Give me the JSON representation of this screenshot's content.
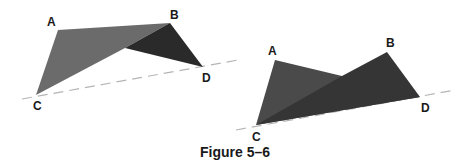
{
  "caption": "Figure 5–6",
  "colors": {
    "light_face": "#6b6b6b",
    "dark_face": "#2a2a2a",
    "right_face_a": "#4a4a4a",
    "right_face_b": "#3a3a3a",
    "dashed_line": "#b5b5b5",
    "text": "#1a1a1a"
  },
  "figures": [
    {
      "name": "left-quadrilateral",
      "labels": {
        "A": "A",
        "B": "B",
        "C": "C",
        "D": "D"
      }
    },
    {
      "name": "right-quadrilateral",
      "labels": {
        "A": "A",
        "B": "B",
        "C": "C",
        "D": "D"
      }
    }
  ]
}
